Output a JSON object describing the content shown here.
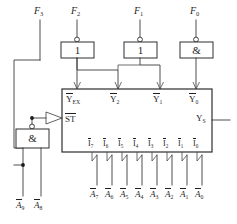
{
  "diagram": {
    "type": "digital-logic-schematic",
    "colors": {
      "line": "#3a3a3a",
      "box_stroke": "#2e2e2e",
      "text": "#1f1f1f",
      "background": "#ffffff"
    }
  },
  "top_inputs": [
    {
      "id": "f3",
      "label": "F",
      "subscript": "3"
    },
    {
      "id": "f2",
      "label": "F",
      "subscript": "2"
    },
    {
      "id": "f1",
      "label": "F",
      "subscript": "1"
    },
    {
      "id": "f0",
      "label": "F",
      "subscript": "0"
    }
  ],
  "top_gates": [
    {
      "id": "gate-f2",
      "symbol": "1",
      "inverted": true
    },
    {
      "id": "gate-f1",
      "symbol": "1",
      "inverted": true
    },
    {
      "id": "gate-f0",
      "symbol": "&",
      "inverted": true
    }
  ],
  "and_gate": {
    "id": "gate-and-lower",
    "symbol": "&",
    "inverted": true
  },
  "encoder": {
    "strobe": {
      "label": "ST",
      "overline": true
    },
    "output": {
      "label": "Y",
      "subscript": "S",
      "overline": false
    },
    "top_outputs": [
      {
        "id": "y-ex",
        "label": "Y",
        "subscript": "EX",
        "overline": true
      },
      {
        "id": "y2",
        "label": "Y",
        "subscript": "2",
        "overline": true
      },
      {
        "id": "y1",
        "label": "Y",
        "subscript": "1",
        "overline": true
      },
      {
        "id": "y0",
        "label": "Y",
        "subscript": "0",
        "overline": true
      }
    ],
    "data_inputs": [
      {
        "id": "i7",
        "label": "I",
        "subscript": "7",
        "overline": true
      },
      {
        "id": "i6",
        "label": "I",
        "subscript": "6",
        "overline": true
      },
      {
        "id": "i5",
        "label": "I",
        "subscript": "5",
        "overline": true
      },
      {
        "id": "i4",
        "label": "I",
        "subscript": "4",
        "overline": true
      },
      {
        "id": "i3",
        "label": "I",
        "subscript": "3",
        "overline": true
      },
      {
        "id": "i2",
        "label": "I",
        "subscript": "2",
        "overline": true
      },
      {
        "id": "i1",
        "label": "I",
        "subscript": "1",
        "overline": true
      },
      {
        "id": "i0",
        "label": "I",
        "subscript": "0",
        "overline": true
      }
    ]
  },
  "bottom_inputs": [
    {
      "id": "a7",
      "label": "A",
      "subscript": "7",
      "overline": true
    },
    {
      "id": "a6",
      "label": "A",
      "subscript": "6",
      "overline": true
    },
    {
      "id": "a5",
      "label": "A",
      "subscript": "5",
      "overline": true
    },
    {
      "id": "a4",
      "label": "A",
      "subscript": "4",
      "overline": true
    },
    {
      "id": "a3",
      "label": "A",
      "subscript": "3",
      "overline": true
    },
    {
      "id": "a2",
      "label": "A",
      "subscript": "2",
      "overline": true
    },
    {
      "id": "a1",
      "label": "A",
      "subscript": "1",
      "overline": true
    },
    {
      "id": "a0",
      "label": "A",
      "subscript": "0",
      "overline": true
    }
  ],
  "left_inputs": [
    {
      "id": "a9",
      "label": "A",
      "subscript": "9",
      "overline": true
    },
    {
      "id": "a8",
      "label": "A",
      "subscript": "8",
      "overline": true
    }
  ]
}
